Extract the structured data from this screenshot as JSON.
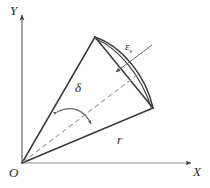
{
  "figure": {
    "background_color": "#ffffff",
    "line_color": "#3a3a3a",
    "dash_color": "#9a9a9a",
    "axes": {
      "y_label": "Y",
      "x_label": "X",
      "origin_label": "O",
      "y_axis_x": 22,
      "x_axis_y": 163
    },
    "labels": {
      "delta": "δ",
      "radius": "r",
      "epsilon": "ε",
      "epsilon_sub": "v"
    },
    "geometry": {
      "origin": [
        22,
        163
      ],
      "apex": [
        95,
        37
      ],
      "right_vertex": [
        153,
        108
      ],
      "arc_mid": [
        148,
        71
      ],
      "axis_dash_end": [
        131,
        80
      ]
    }
  }
}
